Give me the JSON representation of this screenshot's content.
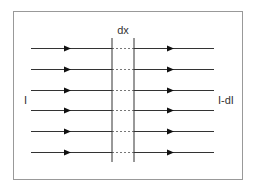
{
  "diagram": {
    "type": "current-flow-slab",
    "labels": {
      "left": "I",
      "right": "I-dI",
      "slab_width": "dx"
    },
    "flow_lines": {
      "count": 6,
      "y": [
        48,
        69,
        90,
        110,
        131,
        152
      ],
      "direction": "left-to-right"
    },
    "colors": {
      "border": "#999999",
      "lines": "#333333",
      "arrows": "#111111",
      "dashes": "#777777",
      "text": "#333333"
    }
  }
}
